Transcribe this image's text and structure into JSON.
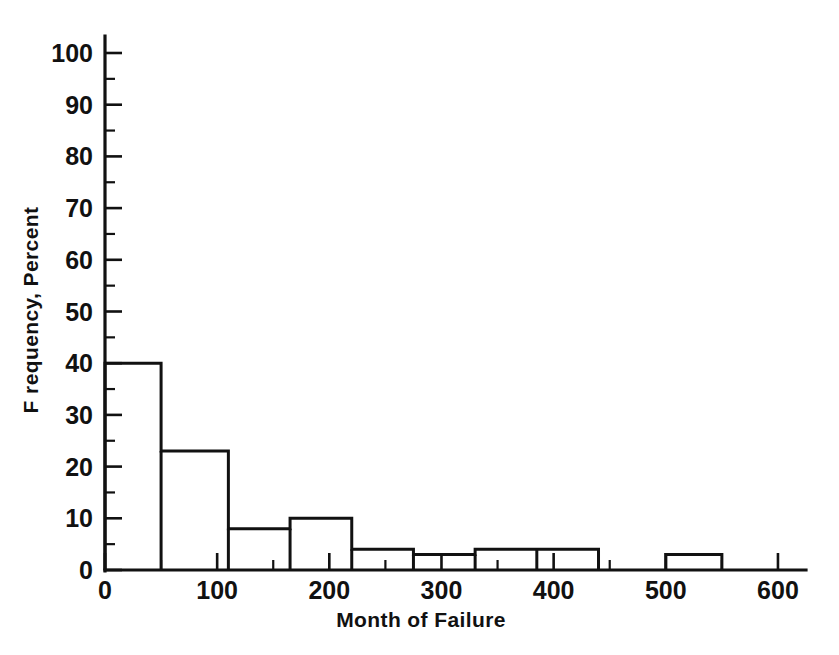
{
  "chart_data": {
    "type": "bar",
    "title": "",
    "subtitle": "",
    "xlabel": "Month of Failure",
    "ylabel": "F requency, Percent",
    "xlim": [
      0,
      625
    ],
    "ylim": [
      0,
      105
    ],
    "grid": false,
    "legend": null,
    "annotations": [],
    "x_major_ticks": [
      0,
      100,
      200,
      300,
      400,
      500,
      600
    ],
    "x_minor_ticks": [
      50,
      150,
      250,
      350,
      450,
      550
    ],
    "x_tick_labels": [
      "0",
      "100",
      "200",
      "300",
      "400",
      "500",
      "600"
    ],
    "y_major_ticks": [
      0,
      10,
      20,
      30,
      40,
      50,
      60,
      70,
      80,
      90,
      100
    ],
    "y_minor_ticks": [
      5,
      15,
      25,
      35,
      45,
      55,
      65,
      75,
      85,
      95
    ],
    "y_tick_labels": [
      "0",
      "10",
      "20",
      "30",
      "40",
      "50",
      "60",
      "70",
      "80",
      "90",
      "100"
    ],
    "bin_edges_note": "histogram bins given as [start, end] in months",
    "bins": [
      {
        "start": 0,
        "end": 50,
        "value": 40
      },
      {
        "start": 50,
        "end": 110,
        "value": 23
      },
      {
        "start": 110,
        "end": 165,
        "value": 8
      },
      {
        "start": 165,
        "end": 220,
        "value": 10
      },
      {
        "start": 220,
        "end": 275,
        "value": 4
      },
      {
        "start": 275,
        "end": 330,
        "value": 3
      },
      {
        "start": 330,
        "end": 385,
        "value": 4
      },
      {
        "start": 385,
        "end": 440,
        "value": 4
      },
      {
        "start": 500,
        "end": 550,
        "value": 3
      }
    ],
    "categories": [
      "0-50",
      "50-110",
      "110-165",
      "165-220",
      "220-275",
      "275-330",
      "330-385",
      "385-440",
      "500-550"
    ],
    "values": [
      40,
      23,
      8,
      10,
      4,
      3,
      4,
      4,
      3
    ],
    "colors": {
      "ink": "#111111",
      "background": "#ffffff",
      "bar_fill": "none",
      "bar_stroke": "#111111"
    }
  }
}
